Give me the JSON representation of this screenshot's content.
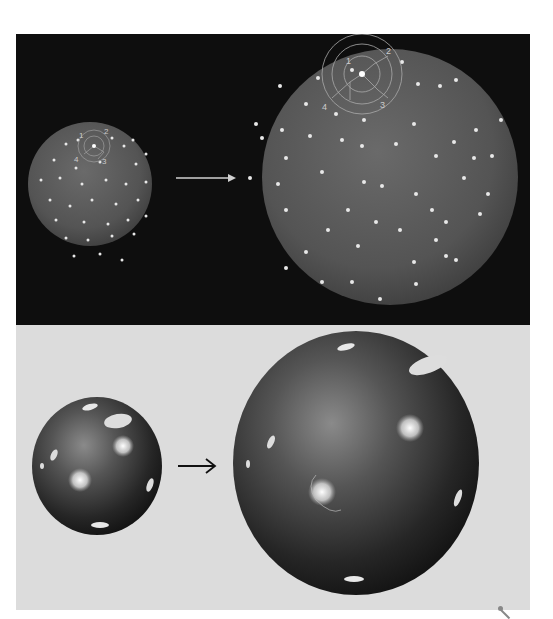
{
  "figure": {
    "top_panel": {
      "description": "Expanding universe analogy: dots on an inflating balloon",
      "background": "#0e0e0e",
      "arrow": "right-arrow",
      "labels": [
        "1",
        "2",
        "3",
        "4"
      ]
    },
    "bottom_panel": {
      "description": "Expanding universe analogy: galaxies on an inflating sphere",
      "background": "#dcdcdc",
      "arrow": "right-arrow"
    }
  }
}
